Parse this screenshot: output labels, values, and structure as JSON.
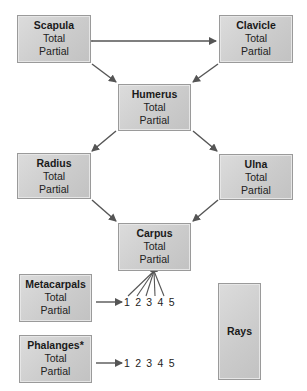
{
  "diagram": {
    "boxes": [
      {
        "id": "scapula",
        "title": "Scapula",
        "lines": [
          "Total",
          "Partial"
        ]
      },
      {
        "id": "clavicle",
        "title": "Clavicle",
        "lines": [
          "Total",
          "Partial"
        ]
      },
      {
        "id": "humerus",
        "title": "Humerus",
        "lines": [
          "Total",
          "Partial"
        ]
      },
      {
        "id": "radius",
        "title": "Radius",
        "lines": [
          "Total",
          "Partial"
        ]
      },
      {
        "id": "ulna",
        "title": "Ulna",
        "lines": [
          "Total",
          "Partial"
        ]
      },
      {
        "id": "carpus",
        "title": "Carpus",
        "lines": [
          "Total",
          "Partial"
        ]
      },
      {
        "id": "metacarpals",
        "title": "Metacarpals",
        "lines": [
          "Total",
          "Partial"
        ]
      },
      {
        "id": "phalanges",
        "title": "Phalanges*",
        "lines": [
          "Total",
          "Partial"
        ]
      },
      {
        "id": "rays",
        "title": "Rays",
        "lines": []
      }
    ],
    "metacarpal_digits": "1 2 3 4 5",
    "phalanx_digits": "1 2 3 4 5",
    "edges": [
      {
        "from": "scapula",
        "to": "clavicle",
        "type": "bidirectional"
      },
      {
        "from": "scapula",
        "to": "humerus"
      },
      {
        "from": "clavicle",
        "to": "humerus"
      },
      {
        "from": "humerus",
        "to": "radius"
      },
      {
        "from": "humerus",
        "to": "ulna"
      },
      {
        "from": "radius",
        "to": "carpus"
      },
      {
        "from": "ulna",
        "to": "carpus"
      },
      {
        "from": "carpus",
        "to": "metacarpal_digits",
        "type": "fan"
      },
      {
        "from": "metacarpals",
        "to": "metacarpal_digits"
      },
      {
        "from": "phalanges",
        "to": "phalanx_digits"
      }
    ],
    "colors": {
      "box_fill": "#cbcbcb",
      "box_border": "#9a9a9a",
      "arrow": "#555555"
    }
  }
}
